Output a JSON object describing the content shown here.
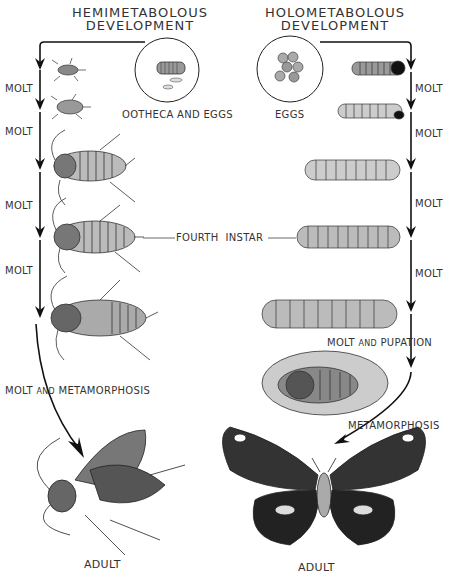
{
  "left": {
    "title_line1": "HEMIMETABOLOUS",
    "title_line2": "DEVELOPMENT",
    "egg_label": "OOTHECA AND EGGS",
    "molt_labels": [
      "MOLT",
      "MOLT",
      "MOLT",
      "MOLT"
    ],
    "final_label_a": "MOLT",
    "final_label_and": "AND",
    "final_label_b": "METAMORPHOSIS",
    "adult_label": "ADULT"
  },
  "right": {
    "title_line1": "HOLOMETABOLOUS",
    "title_line2": "DEVELOPMENT",
    "egg_label": "EGGS",
    "molt_labels": [
      "MOLT",
      "MOLT",
      "MOLT",
      "MOLT"
    ],
    "pupation_label_a": "MOLT",
    "pupation_label_and": "AND",
    "pupation_label_b": "PUPATION",
    "metamorphosis_label": "METAMORPHOSIS",
    "adult_label": "ADULT"
  },
  "shared": {
    "instar_label_a": "FOURTH",
    "instar_label_b": "INSTAR"
  }
}
